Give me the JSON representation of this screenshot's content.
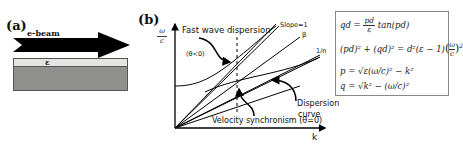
{
  "panel_a": {
    "label": "(a)",
    "beam_label": "e-beam",
    "layer_label": "ε",
    "colors": {
      "arrow": "#000000",
      "top_layer": "#e4e4e2",
      "substrate": "#8f8f8d"
    }
  },
  "panel_b": {
    "label": "(b)",
    "y_axis_label_num": "ω",
    "y_axis_label_den": "c",
    "x_axis_label": "k",
    "annotations": {
      "fast_wave": "Fast wave dispersion",
      "theta_lt": "(θ<0)",
      "slope1": "Slope=1",
      "beta": "β",
      "one_over_n": "1/n",
      "dispersion": "Dispersion",
      "curve": "curve",
      "velocity_sync": "Velocity synchronism (θ=0)"
    }
  },
  "equations": {
    "eq1_lhs": "qd =",
    "eq1_num": "pd",
    "eq1_den": "ε",
    "eq1_rhs": "tan(pd)",
    "eq2": "(pd)² + (qd)² = d²(ε − 1)",
    "eq2_frac_num": "ω",
    "eq2_frac_den": "c",
    "eq2_exp": "2",
    "eq3": "p = √ε(ω/c)² − k²",
    "eq4": "q = √k² − (ω/c)²"
  }
}
